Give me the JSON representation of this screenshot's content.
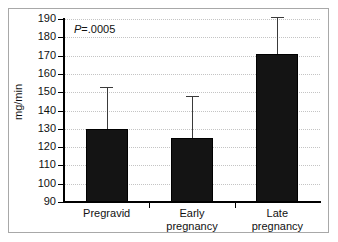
{
  "chart_data": {
    "type": "bar",
    "title": "",
    "subtitle": "",
    "xlabel": "",
    "ylabel": "mg/min",
    "categories": [
      "Pregravid",
      "Early pregnancy",
      "Late pregnancy"
    ],
    "category_lines": [
      [
        "Pregravid"
      ],
      [
        "Early",
        "pregnancy"
      ],
      [
        "Late",
        "pregnancy"
      ]
    ],
    "values": [
      130,
      125,
      171
    ],
    "error_upper": [
      153,
      148,
      191
    ],
    "ylim": [
      90,
      190
    ],
    "ytick_step": 10,
    "yticks": [
      190,
      180,
      170,
      160,
      150,
      140,
      130,
      120,
      110,
      100,
      90
    ],
    "ytick_labels": [
      "190",
      "180",
      "170",
      "160",
      "150",
      "140",
      "130",
      "120",
      "110",
      "100",
      "90"
    ],
    "grid": true,
    "grid_axis": "y",
    "grid_style": "dotted",
    "legend": false,
    "legend_position": "none",
    "bar_color": "#141414",
    "error_bar_color": "#3a3a3a",
    "grid_color": "#c4c4c4",
    "axis_color": "#000000",
    "frame_color": "#a8a8a8",
    "background_color": "#ffffff",
    "annotations": [
      {
        "name": "p-value",
        "prefix": "P",
        "text": "=.0005",
        "full_text": "P=.0005",
        "position": "top-left"
      }
    ]
  }
}
